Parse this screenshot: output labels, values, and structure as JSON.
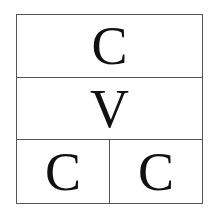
{
  "diagram": {
    "rows": [
      {
        "cells": [
          {
            "label": "C"
          }
        ]
      },
      {
        "cells": [
          {
            "label": "V"
          }
        ]
      },
      {
        "cells": [
          {
            "label": "C"
          },
          {
            "label": "C"
          }
        ]
      }
    ],
    "colors": {
      "border": "#555555",
      "text": "#111111",
      "background": "#ffffff"
    }
  }
}
